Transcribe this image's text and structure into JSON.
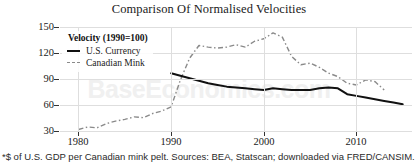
{
  "title": "Comparison Of Normalised Velocities",
  "watermark": "BaseEconomics.com",
  "footnote": "*$ of U.S. GDP per Canadian mink pelt. Sources: BEA, Statscan; downloaded via FRED/CANSIM.",
  "legend": {
    "title": "Velocity (1990=100)",
    "items": [
      {
        "label": "U.S. Currency",
        "style": "solid",
        "color": "#111111"
      },
      {
        "label": "Canadian Mink",
        "style": "dashed",
        "color": "#8a8a8a"
      }
    ]
  },
  "axes": {
    "y_ticks": [
      "150",
      "120",
      "90",
      "60",
      "30"
    ],
    "x_ticks": [
      "1980",
      "1990",
      "2000",
      "2010"
    ]
  },
  "chart_data": {
    "type": "line",
    "title": "Comparison Of Normalised Velocities",
    "subtitle": "Velocity (1990=100)",
    "xlabel": "",
    "ylabel": "",
    "xlim": [
      1978,
      2016
    ],
    "ylim": [
      30,
      155
    ],
    "y_ticks": [
      150,
      120,
      90,
      60,
      30
    ],
    "x_ticks": [
      1980,
      1990,
      2000,
      2010
    ],
    "grid": true,
    "legend_position": "upper-left",
    "annotation": "*$ of U.S. GDP per Canadian mink pelt. Sources: BEA, Statscan; downloaded via FRED/CANSIM.",
    "series": [
      {
        "name": "U.S. Currency",
        "style": "solid",
        "color": "#111111",
        "x": [
          1990,
          1991,
          1992,
          1993,
          1994,
          1995,
          1996,
          1997,
          1998,
          1999,
          2000,
          2001,
          2002,
          2003,
          2004,
          2005,
          2006,
          2007,
          2008,
          2009,
          2010,
          2011,
          2012,
          2013,
          2014,
          2015
        ],
        "y": [
          100,
          97,
          94,
          91,
          88,
          86,
          84,
          83,
          82,
          81,
          80,
          82,
          81,
          80,
          80,
          80,
          82,
          83,
          82,
          75,
          73,
          71,
          69,
          67,
          65,
          63
        ]
      },
      {
        "name": "Canadian Mink",
        "style": "dashed",
        "color": "#8a8a8a",
        "x": [
          1980,
          1981,
          1982,
          1983,
          1984,
          1985,
          1986,
          1987,
          1988,
          1989,
          1990,
          1991,
          1992,
          1993,
          1994,
          1995,
          1996,
          1997,
          1998,
          1999,
          2000,
          2001,
          2002,
          2003,
          2004,
          2005,
          2006,
          2007,
          2008,
          2009,
          2010,
          2011,
          2012,
          2013
        ],
        "y": [
          33,
          36,
          35,
          40,
          43,
          45,
          48,
          47,
          52,
          55,
          60,
          92,
          118,
          133,
          131,
          130,
          131,
          134,
          131,
          138,
          141,
          148,
          143,
          120,
          110,
          112,
          107,
          100,
          96,
          88,
          86,
          92,
          90,
          80
        ]
      }
    ]
  }
}
